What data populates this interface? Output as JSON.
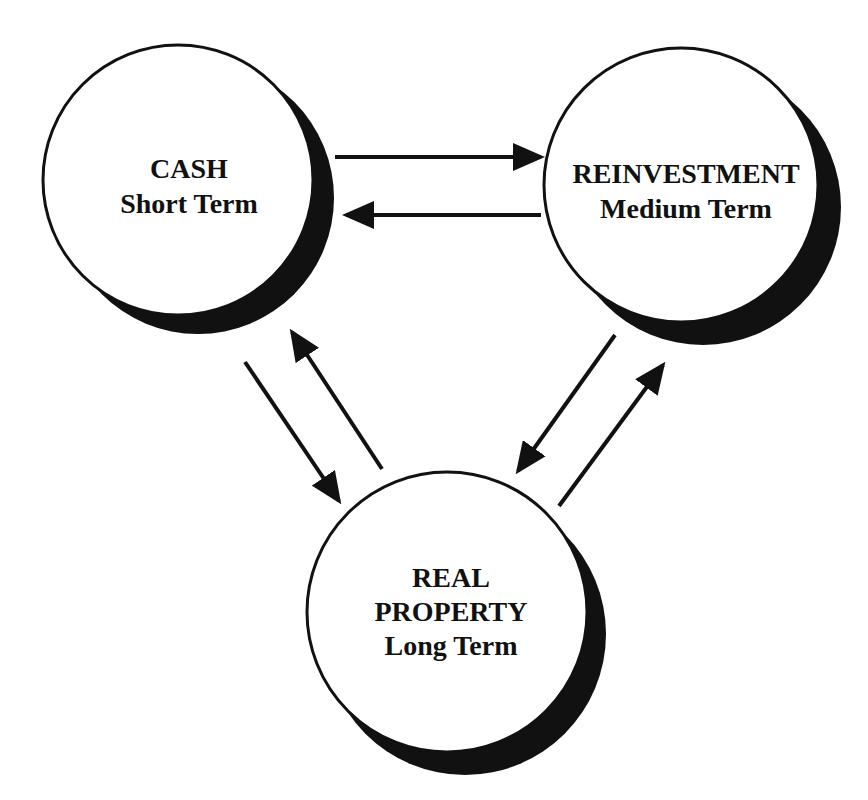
{
  "diagram": {
    "colors": {
      "background": "#ffffff",
      "ink": "#111111",
      "circle_fill": "#ffffff"
    },
    "nodes": [
      {
        "id": "cash",
        "lines": [
          "CASH",
          "Short Term"
        ]
      },
      {
        "id": "reinvestment",
        "lines": [
          "REINVESTMENT",
          "Medium Term"
        ]
      },
      {
        "id": "real_property",
        "lines": [
          "REAL",
          "PROPERTY",
          "Long Term"
        ]
      }
    ],
    "edges": [
      {
        "from": "cash",
        "to": "reinvestment"
      },
      {
        "from": "reinvestment",
        "to": "cash"
      },
      {
        "from": "cash",
        "to": "real_property"
      },
      {
        "from": "real_property",
        "to": "cash"
      },
      {
        "from": "reinvestment",
        "to": "real_property"
      },
      {
        "from": "real_property",
        "to": "reinvestment"
      }
    ]
  }
}
